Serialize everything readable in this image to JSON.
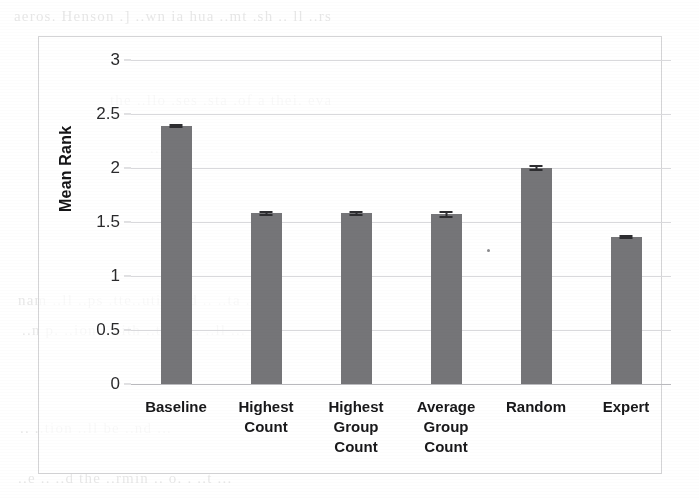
{
  "chart_data": {
    "type": "bar",
    "title": "",
    "xlabel": "",
    "ylabel": "Mean Rank",
    "ylim": [
      0,
      3
    ],
    "ytick_labels": [
      "3",
      "2.5",
      "2",
      "1.5",
      "1",
      "0.5",
      "0"
    ],
    "yticks": [
      3,
      2.5,
      2,
      1.5,
      1,
      0.5,
      0
    ],
    "grid": true,
    "legend": "none",
    "bar_color": "#757578",
    "categories": [
      "Baseline",
      "Highest\nCount",
      "Highest\nGroup\nCount",
      "Average\nGroup\nCount",
      "Random",
      "Expert"
    ],
    "values": [
      2.39,
      1.58,
      1.58,
      1.57,
      2.0,
      1.36
    ],
    "errors": [
      0.02,
      0.02,
      0.02,
      0.03,
      0.03,
      0.02
    ],
    "bars": [
      {
        "label": "Baseline",
        "value": 2.39,
        "error": 0.02
      },
      {
        "label": "Highest\nCount",
        "value": 1.58,
        "error": 0.02
      },
      {
        "label": "Highest\nGroup\nCount",
        "value": 1.58,
        "error": 0.02
      },
      {
        "label": "Average\nGroup\nCount",
        "value": 1.57,
        "error": 0.03
      },
      {
        "label": "Random",
        "value": 2.0,
        "error": 0.03
      },
      {
        "label": "Expert",
        "value": 1.36,
        "error": 0.02
      }
    ]
  },
  "background_text": {
    "line_top": "aeros. Henson .] ..wn ia hua ..mt   .sh ..   ll ..rs",
    "line_upper": "the  ..llo .ses .sta    .of  a thei. eva",
    "line_mid_a": "..n ...",
    "line_mid_b": "nam  ..ll   ..ps  .tte..utim  ..d .. ..ta ..t",
    "line_mid_c": "..n p. ..ion . ..ith  ..tcom . ..ll ...",
    "line_bot_a": "..   ..tion ..ll be    ..nd ...",
    "line_bot_b": "..e .. ..d the  ..rmin  .. o. .  ..t ..."
  }
}
